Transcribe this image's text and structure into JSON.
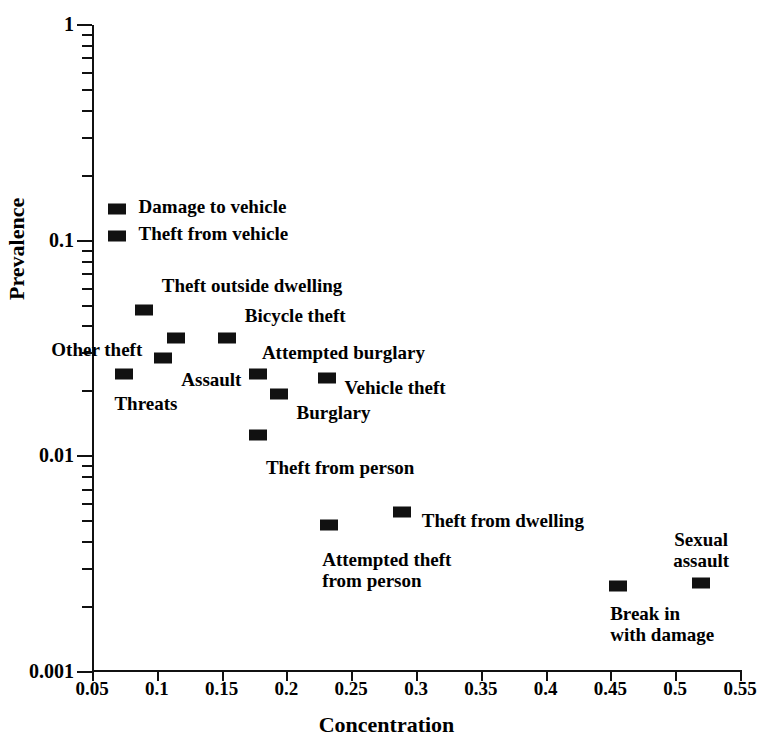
{
  "chart_data": {
    "type": "scatter",
    "title": "",
    "xlabel": "Concentration",
    "ylabel": "Prevalence",
    "xlim": [
      0.05,
      0.55
    ],
    "ylim": [
      0.001,
      1
    ],
    "yscale": "log",
    "xscale": "linear",
    "grid": false,
    "legend": "none",
    "xticks": [
      "0.05",
      "0.1",
      "0.15",
      "0.2",
      "0.25",
      "0.3",
      "0.35",
      "0.4",
      "0.45",
      "0.5",
      "0.55"
    ],
    "xtick_values": [
      0.05,
      0.1,
      0.15,
      0.2,
      0.25,
      0.3,
      0.35,
      0.4,
      0.45,
      0.5,
      0.55
    ],
    "yticks": [
      "1",
      "0.1",
      "0.01",
      "0.001"
    ],
    "ytick_values": [
      1,
      0.1,
      0.01,
      0.001
    ],
    "points": [
      {
        "label": "Damage to vehicle",
        "x": 0.069,
        "y": 0.14,
        "lab_dx": 22,
        "lab_dy": -11,
        "align": "l"
      },
      {
        "label": "Theft from vehicle",
        "x": 0.069,
        "y": 0.105,
        "lab_dx": 22,
        "lab_dy": -11,
        "align": "l"
      },
      {
        "label": "Theft outside dwelling",
        "x": 0.09,
        "y": 0.0475,
        "lab_dx": 18,
        "lab_dy": -33,
        "align": "l"
      },
      {
        "label": "Bicycle theft",
        "x": 0.154,
        "y": 0.0355,
        "lab_dx": 18,
        "lab_dy": -31,
        "align": "l"
      },
      {
        "label": "Other theft",
        "x": 0.115,
        "y": 0.0355,
        "lab_dx": -34,
        "lab_dy": 3,
        "align": "r"
      },
      {
        "label": "Assault",
        "x": 0.105,
        "y": 0.0285,
        "lab_dx": 18,
        "lab_dy": 13,
        "align": "l"
      },
      {
        "label": "Attempted burglary",
        "x": 0.178,
        "y": 0.0242,
        "lab_dx": 4,
        "lab_dy": -30,
        "align": "l"
      },
      {
        "label": "Vehicle theft",
        "x": 0.231,
        "y": 0.0232,
        "lab_dx": 18,
        "lab_dy": 1,
        "align": "l"
      },
      {
        "label": "Threats",
        "x": 0.075,
        "y": 0.0242,
        "lab_dx": -10,
        "lab_dy": 21,
        "align": "l"
      },
      {
        "label": "Burglary",
        "x": 0.194,
        "y": 0.0195,
        "lab_dx": 18,
        "lab_dy": 10,
        "align": "l"
      },
      {
        "label": "Theft from person",
        "x": 0.178,
        "y": 0.0126,
        "lab_dx": 8,
        "lab_dy": 24,
        "align": "l"
      },
      {
        "label": "Theft from dwelling",
        "x": 0.289,
        "y": 0.0055,
        "lab_dx": 20,
        "lab_dy": 0,
        "align": "l"
      },
      {
        "label": "Attempted theft\nfrom person",
        "x": 0.233,
        "y": 0.0048,
        "lab_dx": -7,
        "lab_dy": 26,
        "align": "l"
      },
      {
        "label": "Break in\nwith damage",
        "x": 0.456,
        "y": 0.0025,
        "lab_dx": -8,
        "lab_dy": 19,
        "align": "l"
      },
      {
        "label": "Sexual\nassault",
        "x": 0.52,
        "y": 0.0026,
        "lab_dx": 0,
        "lab_dy": -52,
        "align": "c"
      }
    ]
  },
  "axes": {
    "x_title": "Concentration",
    "y_title": "Prevalence"
  },
  "colors": {
    "marker": "#111111",
    "axis": "#111111",
    "background": "#ffffff"
  }
}
